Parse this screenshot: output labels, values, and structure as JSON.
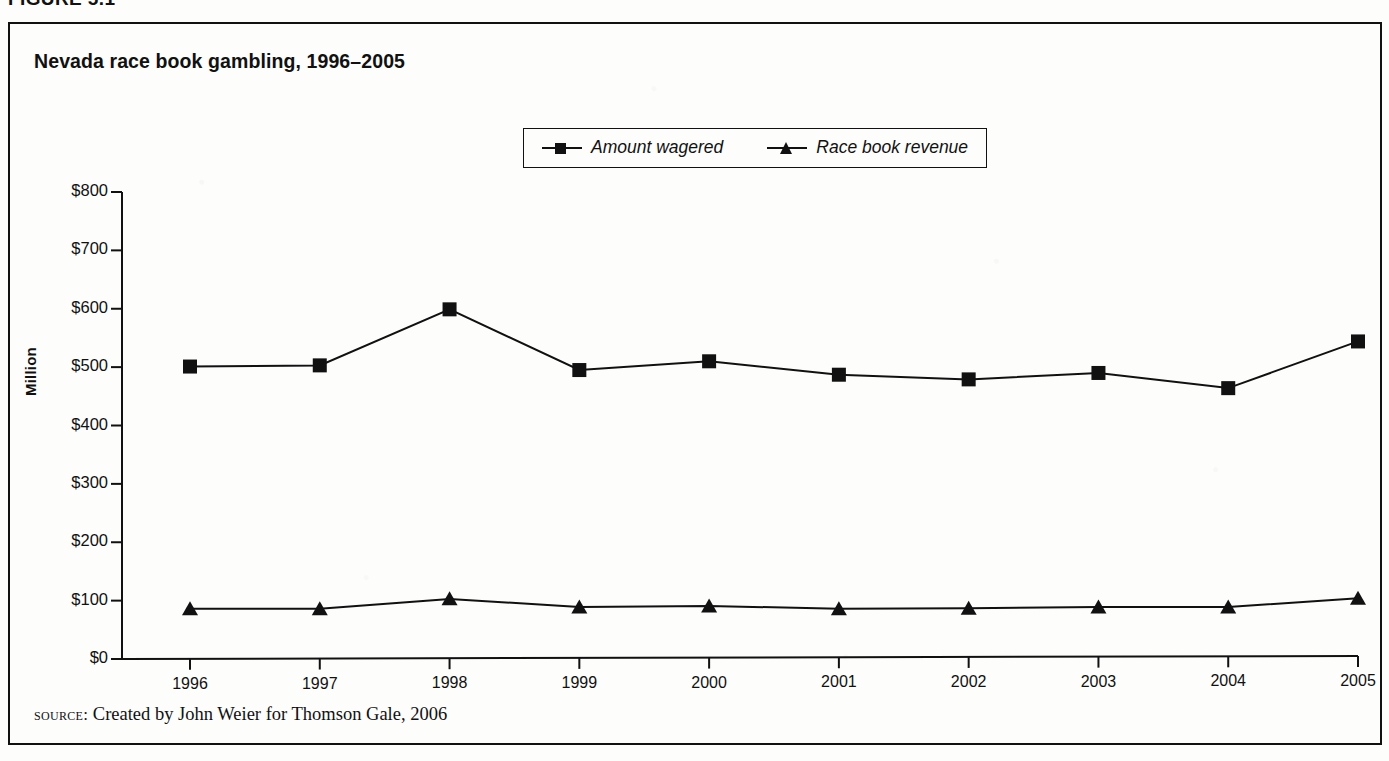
{
  "figure": {
    "caption": "FIGURE 5.1"
  },
  "chart_title": "Nevada race book gambling, 1996–2005",
  "source": {
    "label": "source:",
    "text": "Created by John Weier for Thomson Gale, 2006"
  },
  "legend": {
    "position": "top-center",
    "entries": [
      {
        "label": "Amount wagered",
        "marker": "square-marker"
      },
      {
        "label": "Race book revenue",
        "marker": "triangle-marker"
      }
    ]
  },
  "axes": {
    "y_title": "Million",
    "y_ticks": [
      "$0",
      "$100",
      "$200",
      "$300",
      "$400",
      "$500",
      "$600",
      "$700",
      "$800"
    ],
    "x_ticks": [
      "1996",
      "1997",
      "1998",
      "1999",
      "2000",
      "2001",
      "2002",
      "2003",
      "2004",
      "2005"
    ]
  },
  "colors": {
    "ink": "#111111",
    "paper": "#fdfdfc"
  },
  "chart_data": {
    "type": "line",
    "title": "Nevada race book gambling, 1996–2005",
    "xlabel": "",
    "ylabel": "Million",
    "ylim": [
      0,
      800
    ],
    "ytick_step": 100,
    "ytick_prefix": "$",
    "grid": false,
    "legend": "top-center",
    "units": "millions of US dollars",
    "categories": [
      "1996",
      "1997",
      "1998",
      "1999",
      "2000",
      "2001",
      "2002",
      "2003",
      "2004",
      "2005"
    ],
    "series": [
      {
        "name": "Amount wagered",
        "marker": "square",
        "values": [
          501,
          503,
          599,
          495,
          510,
          487,
          479,
          490,
          464,
          544
        ]
      },
      {
        "name": "Race book revenue",
        "marker": "triangle",
        "values": [
          86,
          86,
          103,
          89,
          91,
          86,
          87,
          89,
          89,
          104
        ]
      }
    ]
  }
}
